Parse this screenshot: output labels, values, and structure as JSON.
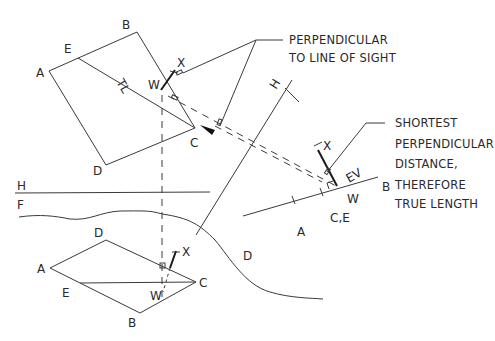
{
  "colors": {
    "line": "#3a3a3a",
    "text": "#2a2a2a",
    "background": "#ffffff"
  },
  "top_view": {
    "labels": {
      "A": "A",
      "B": "B",
      "C": "C",
      "D": "D",
      "E": "E",
      "W": "W",
      "X": "X",
      "TL": "TL"
    }
  },
  "front_view": {
    "labels": {
      "A": "A",
      "B": "B",
      "C": "C",
      "D": "D",
      "E": "E",
      "W": "W",
      "X": "X"
    }
  },
  "fold_lines": {
    "hf": {
      "upper": "H",
      "lower": "F"
    },
    "h1": {
      "upper": "H",
      "lower": "1"
    }
  },
  "auxiliary_view": {
    "labels": {
      "A": "A",
      "B": "B",
      "CE": "C,E",
      "D": "D",
      "W": "W",
      "X": "X",
      "EV": "EV"
    }
  },
  "notes": {
    "perpendicular": [
      "PERPENDICULAR",
      "TO LINE OF SIGHT"
    ],
    "shortest": [
      "SHORTEST",
      "PERPENDICULAR",
      "DISTANCE,",
      "THEREFORE",
      "TRUE LENGTH"
    ]
  }
}
